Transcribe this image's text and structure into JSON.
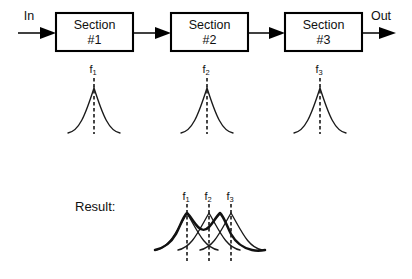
{
  "diagram": {
    "background_color": "#ffffff",
    "line_color": "#000000",
    "signal_flow": {
      "input_label": "In",
      "output_label": "Out",
      "blocks": [
        {
          "line1": "Section",
          "line2": "#1"
        },
        {
          "line1": "Section",
          "line2": "#2"
        },
        {
          "line1": "Section",
          "line2": "#3"
        }
      ]
    },
    "response_curves": {
      "labels": [
        {
          "base": "f",
          "sub": "1"
        },
        {
          "base": "f",
          "sub": "2"
        },
        {
          "base": "f",
          "sub": "3"
        }
      ]
    },
    "result": {
      "label": "Result:",
      "labels": [
        {
          "base": "f",
          "sub": "1"
        },
        {
          "base": "f",
          "sub": "2"
        },
        {
          "base": "f",
          "sub": "3"
        }
      ]
    }
  }
}
